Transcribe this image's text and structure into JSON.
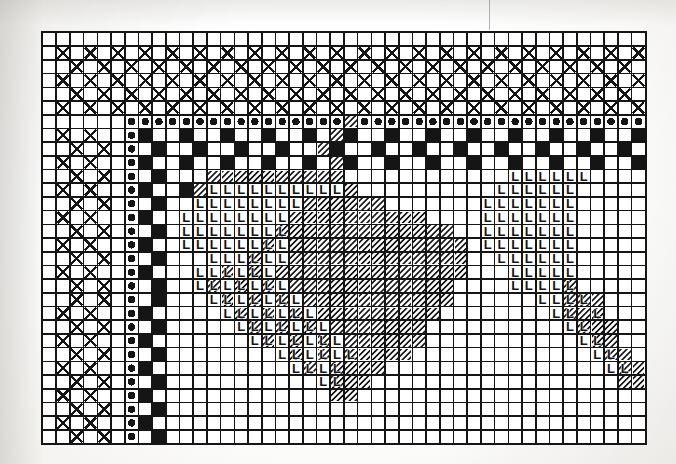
{
  "document": {
    "kind": "needlework-pattern-chart",
    "title": "Cross-stitch / Filet chart",
    "media": "scanned book page, black ink on white grid paper",
    "background_color": "#fbfbfa",
    "ink_color": "#151515"
  },
  "grid": {
    "columns": 44,
    "rows": 30,
    "cell_size_px": 13.7,
    "origin_x_px": 41,
    "origin_y_px": 31,
    "width_px": 603,
    "height_px": 411,
    "line_color": "#151515",
    "line_width_px": 1.6,
    "heavy_line_every": 0,
    "border_visible": true
  },
  "legend": {
    "symbols": [
      {
        "key": "blank",
        "name": "empty-cell",
        "label": "",
        "description": "unworked square"
      },
      {
        "key": "cross",
        "name": "cross-symbol",
        "label": "X",
        "description": "large X filling the square"
      },
      {
        "key": "dot",
        "name": "dot-symbol",
        "label": "●",
        "description": "solid round dot centred in square"
      },
      {
        "key": "solid",
        "name": "solid-fill-symbol",
        "label": "",
        "description": "fully blacked-in square"
      },
      {
        "key": "hatch",
        "name": "hatch-symbol",
        "label": "",
        "description": "45 degree diagonal line hatching"
      },
      {
        "key": "L",
        "name": "ell-symbol",
        "label": "L",
        "description": "bold capital L"
      },
      {
        "key": "Lhatch",
        "name": "ell-on-hatch-symbol",
        "label": "L",
        "description": "bold capital L over diagonal hatching"
      }
    ]
  },
  "chart_data": {
    "type": "heatmap",
    "xlabel": "",
    "ylabel": "",
    "grid": true,
    "legend_position": "none",
    "categories_x": [
      0,
      1,
      2,
      3,
      4,
      5,
      6,
      7,
      8,
      9,
      10,
      11,
      12,
      13,
      14,
      15,
      16,
      17,
      18,
      19,
      20,
      21,
      22,
      23,
      24,
      25,
      26,
      27,
      28,
      29,
      30,
      31,
      32,
      33,
      34,
      35,
      36,
      37,
      38,
      39,
      40,
      41,
      42,
      43
    ],
    "categories_y": [
      0,
      1,
      2,
      3,
      4,
      5,
      6,
      7,
      8,
      9,
      10,
      11,
      12,
      13,
      14,
      15,
      16,
      17,
      18,
      19,
      20,
      21,
      22,
      23,
      24,
      25,
      26,
      27,
      28,
      29
    ],
    "symbol_key": [
      "blank",
      "cross",
      "dot",
      "solid",
      "hatch",
      "L",
      "Lhatch"
    ],
    "rows": [
      "00000000000000000000000000000000000000000000",
      "01010101010101010101010101010101010101010101",
      "00101010101010101010101010101010101010101010",
      "01010101010101010101010101010101010101010101",
      "00101010101010101010101010101010101010101010",
      "01010101010101010101010101010101010101010101",
      "00000022222222222222224222222222222222222222",
      "01010023003003003003043003003003003003003003",
      "00101020300300300300430030030030030030030030",
      "01010023003003003003043003003003003003003003",
      "00101020300044444444440000000000005555550000",
      "01010023003455555555554000000000055555500000",
      "00101020300555555554444440000000555555500000",
      "01010023005555555544444444440000555555500000",
      "00101020305555555644444444444400555555500000",
      "01010023005555556544444444444440555555500000",
      "00101020300055565544444444444440055555500000",
      "01010023000556565444444444444440005555500000",
      "00101020300565656544444444444400005555600000",
      "00101020300056565654444444444400000055664000",
      "01010023000005656565444444444000000005646000",
      "00101020300000565656544444440000000000564400",
      "01010023000000056565654444440000000000056400",
      "00101020300000000565656444400000000000005640",
      "01010023000000000056564440000000000000000564",
      "00101020300000000000564400000000000000000044",
      "01010023000000000000044000000000000000000000",
      "00101020300000000000000000000000000000000000",
      "01010023000000000000000000000000000000000000",
      "00101020300000000000000000000000000000000000"
    ],
    "notes": [
      "Rows 1-5, columns 0-5 carry a field of X crosses (staircase diagonal field).",
      "Row 6 is a continuous run of dots from column 6 to column 43.",
      "Column 6 below row 6 is a continuous column of dots.",
      "Columns 7-8 carry a vertical black checkerboard spine.",
      "Rows 7-9 carry a horizontal black brick/checkerboard band across the width.",
      "Column 20 rows 6-9 is hatched rather than dotted/solid.",
      "A diagonal heart/leaf shaped block of hatching sits centre-right, rows 10-25.",
      "Bold L symbols fill the lower-left lobe and a separate block at columns 36-42."
    ]
  },
  "marks": {
    "cross_field": {
      "name": "cross-field",
      "description": "X symbols on alternating squares, rows 1-29, columns 0-5",
      "count_approx": 90
    },
    "dot_row": {
      "name": "dot-row",
      "row_index": 6,
      "from_column": 6,
      "to_column": 43,
      "count": 38
    },
    "dot_column": {
      "name": "dot-column",
      "column_index": 6,
      "from_row": 6,
      "to_row": 29,
      "count": 24
    },
    "solid_spine": {
      "name": "solid-checker-spine",
      "columns": [
        7,
        8
      ],
      "from_row": 7,
      "to_row": 29
    },
    "brick_band": {
      "name": "solid-brick-band",
      "rows": [
        7,
        8,
        9
      ],
      "from_column": 9,
      "to_column": 43
    },
    "hatch_block": {
      "name": "diagonal-hatch-block",
      "description": "large hatched lobe, rows 10-26, columns 12-33 plus tail",
      "hatch_angle_deg": 45,
      "hatch_spacing_px": 3.2
    },
    "ell_block_left": {
      "name": "ell-block-left",
      "description": "L symbols forming the lower-left lobe of the motif",
      "rows": "10-26",
      "columns": "11-30"
    },
    "ell_block_right": {
      "name": "ell-block-right",
      "description": "small separate L block at the right margin",
      "rows": "10-24",
      "columns": "35-43"
    }
  }
}
